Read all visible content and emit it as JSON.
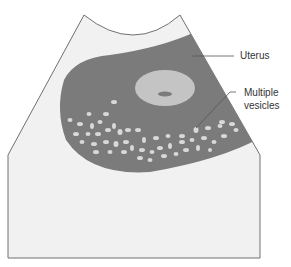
{
  "diagram": {
    "type": "ultrasound schematic",
    "labels": {
      "uterus": "Uterus",
      "vesicles_line1": "Multiple",
      "vesicles_line2": "vesicles"
    },
    "colors": {
      "background": "#ffffff",
      "scan_field": "#f1f1f1",
      "uterus": "#7b7b7b",
      "inner_sac": "#c4c4c4",
      "vesicle": "#d8d8d8",
      "outline": "#707070",
      "text": "#333333"
    }
  }
}
